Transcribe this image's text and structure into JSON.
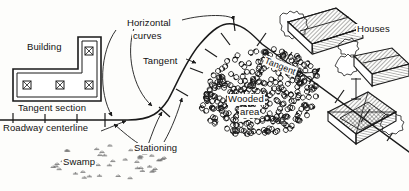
{
  "figure": {
    "type": "line-drawing",
    "background_color": "#fdfdfb",
    "ink_color": "#1a1a1a",
    "width": 409,
    "height": 191
  },
  "labels": {
    "building": "Building",
    "tangent_section": "Tangent section",
    "roadway_centerline": "Roadway centerline",
    "swamp": "Swamp",
    "horizontal_curves_line1": "Horizontal",
    "horizontal_curves_line2": "curves",
    "tangent": "Tangent",
    "stationing": "Stationing",
    "wooded_area_line1": "Wooded",
    "wooded_area_line2": "area",
    "tangent_road": "Tangent",
    "houses": "Houses"
  },
  "map_features": {
    "building": {
      "name": "Building",
      "shape": "L-shaped double-line plan",
      "column_symbols": 4,
      "column_symbol_name": "crossed-square-column"
    },
    "roadway": {
      "name": "Roadway centerline",
      "segments": [
        "tangent section",
        "horizontal curve",
        "tangent",
        "horizontal curve",
        "tangent"
      ],
      "station_tick_count": 16
    },
    "swamp": {
      "name": "Swamp",
      "symbol": "marsh-tuft-pattern",
      "tuft_count": 46
    },
    "wooded_area": {
      "name": "Wooded area",
      "symbol": "tree-circle-pattern",
      "tree_count": 330
    },
    "houses": {
      "name": "Houses",
      "count": 3,
      "symbol": "isometric-hatched-roof-house"
    }
  }
}
